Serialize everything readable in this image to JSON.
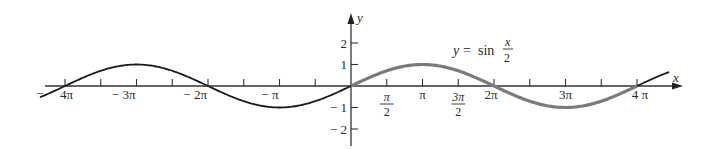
{
  "chart_data": {
    "type": "line",
    "title": "",
    "function_label": {
      "lhs": "y",
      "eq": "=",
      "fn": "sin",
      "num": "x",
      "den": "2"
    },
    "xlabel": "x",
    "ylabel": "y",
    "xlim": [
      -4.3,
      4.6
    ],
    "xlim_units": "multiples of pi",
    "ylim": [
      -2.6,
      3.4
    ],
    "grid": false,
    "x_ticks_pi": [
      -4,
      -3.5,
      -3,
      -2.5,
      -2,
      -1.5,
      -1,
      -0.5,
      0,
      0.5,
      1,
      1.5,
      2,
      2.5,
      3,
      3.5,
      4
    ],
    "x_tick_labels": [
      {
        "at": -4,
        "text": "4π",
        "minus": "−"
      },
      {
        "at": -3,
        "text": "− 3π"
      },
      {
        "at": -2,
        "text": "− 2π"
      },
      {
        "at": -1,
        "text": "− π"
      },
      {
        "at": 0.5,
        "num": "π",
        "den": "2"
      },
      {
        "at": 1,
        "text": "π"
      },
      {
        "at": 1.5,
        "num": "3π",
        "den": "2"
      },
      {
        "at": 2,
        "text": "2π"
      },
      {
        "at": 3,
        "text": "3π"
      },
      {
        "at": 4,
        "text": "4 π"
      }
    ],
    "y_ticks": [
      2,
      1,
      -1,
      -2
    ],
    "y_tick_labels": [
      "2",
      "1",
      "− 1",
      "− 2"
    ],
    "series": [
      {
        "name": "y = sin(x/2), one period [0, 4π] (highlighted)",
        "color": "#7a7a7a",
        "x_pi": [
          0,
          0.5,
          1,
          1.5,
          2,
          2.5,
          3,
          3.5,
          4
        ],
        "values": [
          0,
          0.707,
          1,
          0.707,
          0,
          -0.707,
          -1,
          -0.707,
          0
        ]
      },
      {
        "name": "y = sin(x/2), continuation",
        "color": "#1a1a1a",
        "x_pi": [
          -4.3,
          -4,
          -3.5,
          -3,
          -2.5,
          -2,
          -1.5,
          -1,
          -0.5,
          0,
          4,
          4.3
        ],
        "values": [
          -0.454,
          0,
          0.707,
          1,
          0.707,
          0,
          -0.707,
          -1,
          -0.707,
          0,
          0,
          0.454
        ]
      }
    ]
  }
}
